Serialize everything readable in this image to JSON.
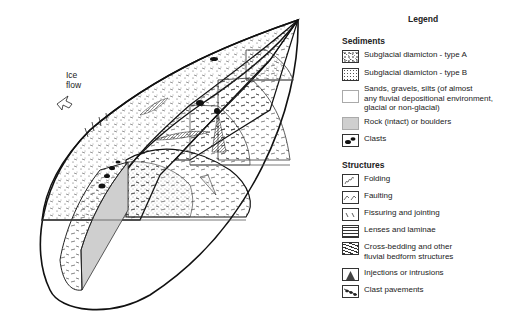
{
  "diagram": {
    "ice_flow_label_line1": "Ice",
    "ice_flow_label_line2": "flow",
    "ice_flow_icon": "arrow-icon"
  },
  "legend": {
    "title": "Legend",
    "sediments": {
      "title": "Sediments",
      "items": [
        {
          "label": "Subglacial diamicton - type A",
          "icon": "diamicton-a-swatch"
        },
        {
          "label": "Subglacial diamicton - type B",
          "icon": "diamicton-b-swatch"
        },
        {
          "label_lines": [
            "Sands, gravels, silts (of almost",
            "any fluvial depositional environment,",
            "glacial or non-glacial)"
          ],
          "icon": "sands-swatch"
        },
        {
          "label": "Rock (intact) or boulders",
          "icon": "rock-swatch",
          "color": "#cfcfcf"
        },
        {
          "label": "Clasts",
          "icon": "clasts-swatch"
        }
      ]
    },
    "structures": {
      "title": "Structures",
      "items": [
        {
          "label": "Folding",
          "icon": "folding-icon"
        },
        {
          "label": "Faulting",
          "icon": "faulting-icon"
        },
        {
          "label": "Fissuring and jointing",
          "icon": "fissuring-icon"
        },
        {
          "label": "Lenses and laminae",
          "icon": "lenses-icon"
        },
        {
          "label_lines": [
            "Cross-bedding and other",
            "fluvial bedform structures"
          ],
          "icon": "cross-bedding-icon"
        },
        {
          "label": "Injections or intrusions",
          "icon": "injection-icon"
        },
        {
          "label": "Clast pavements",
          "icon": "clast-pavement-icon"
        }
      ]
    }
  }
}
